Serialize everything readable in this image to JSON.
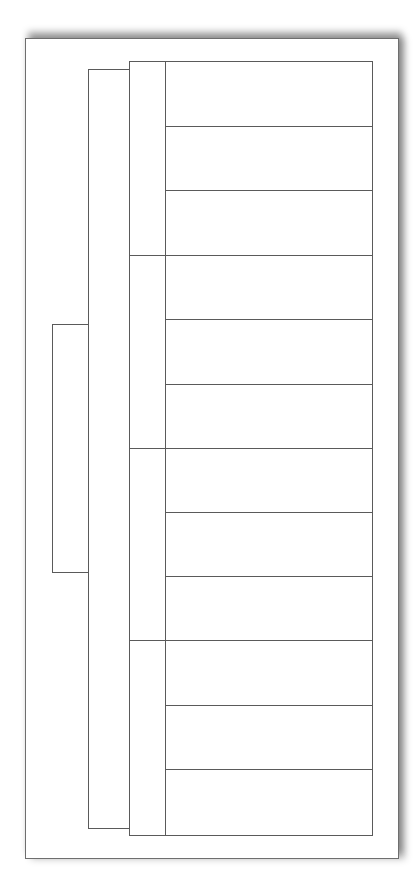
{
  "diagram": {
    "type": "bracket-tree",
    "line_color": "#5a5a5a",
    "background": "#ffffff",
    "root": {
      "label": "",
      "children_count": 1
    },
    "level1": {
      "label": "",
      "children_count": 4
    },
    "groups": [
      {
        "label": "",
        "cells": [
          "",
          "",
          ""
        ]
      },
      {
        "label": "",
        "cells": [
          "",
          "",
          ""
        ]
      },
      {
        "label": "",
        "cells": [
          "",
          "",
          ""
        ]
      },
      {
        "label": "",
        "cells": [
          "",
          "",
          ""
        ]
      }
    ]
  }
}
